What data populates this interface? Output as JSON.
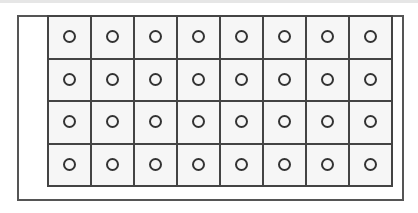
{
  "diagram": {
    "type": "well-plate-grid",
    "rows": 4,
    "columns": 8,
    "cell_marker": "circle",
    "colors": {
      "border": "#444444",
      "cell_fill": "#f6f6f6",
      "frame": "#555555"
    }
  }
}
